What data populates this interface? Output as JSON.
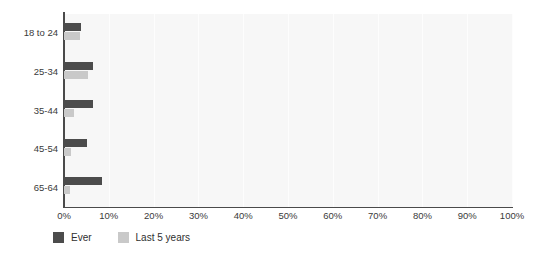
{
  "chart_data": {
    "type": "bar",
    "orientation": "horizontal",
    "title": "",
    "subtitle": "",
    "xlabel": "",
    "ylabel": "",
    "categories": [
      "18 to 24",
      "25-34",
      "35-44",
      "45-54",
      "65-64"
    ],
    "series": [
      {
        "name": "Ever",
        "color": "#4c4c4c",
        "values": [
          3.8,
          6.5,
          6.5,
          5.1,
          8.5
        ]
      },
      {
        "name": "Last 5 years",
        "color": "#c9c9c9",
        "values": [
          3.5,
          5.4,
          2.3,
          1.6,
          1.3
        ]
      }
    ],
    "xlim": [
      0,
      100
    ],
    "xticks": [
      0,
      10,
      20,
      30,
      40,
      50,
      60,
      70,
      80,
      90,
      100
    ],
    "xtick_labels": [
      "0%",
      "10%",
      "20%",
      "30%",
      "40%",
      "50%",
      "60%",
      "70%",
      "80%",
      "90%",
      "100%"
    ],
    "grid": true,
    "grid_axis": "x",
    "legend_position": "bottom-left",
    "plot_background": "#f7f7f7",
    "gridline_color": "#fdfdfd",
    "axis_color": "#4a4a4a"
  },
  "legend": {
    "items": [
      {
        "label": "Ever",
        "color": "#4c4c4c"
      },
      {
        "label": "Last 5 years",
        "color": "#c9c9c9"
      }
    ]
  }
}
